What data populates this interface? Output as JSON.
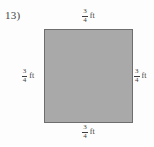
{
  "problem": {
    "number_label": "13)"
  },
  "figure": {
    "shape_name": "square",
    "fill_color": "#a9a9a9",
    "stroke_color": "#6e6e6e"
  },
  "labels": {
    "top": {
      "numerator": "3",
      "denominator": "4",
      "unit": "ft"
    },
    "right": {
      "numerator": "3",
      "denominator": "4",
      "unit": "ft"
    },
    "bottom": {
      "numerator": "3",
      "denominator": "4",
      "unit": "ft"
    },
    "left": {
      "numerator": "3",
      "denominator": "4",
      "unit": "ft"
    }
  }
}
